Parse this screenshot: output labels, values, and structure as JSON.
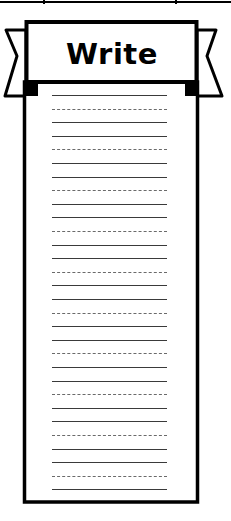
{
  "header": {
    "title": "Write"
  },
  "top_rule": {
    "tick_positions_x": [
      44,
      176
    ]
  },
  "bookmark": {
    "border_color": "#000000",
    "background_color": "#ffffff",
    "line_pattern": [
      "solid",
      "dashed",
      "solid"
    ],
    "line_start_y": 95,
    "line_spacing": 13.6,
    "line_count": 30,
    "lines": [
      "solid",
      "dashed",
      "solid",
      "solid",
      "dashed",
      "solid",
      "solid",
      "dashed",
      "solid",
      "solid",
      "dashed",
      "solid",
      "solid",
      "dashed",
      "solid",
      "solid",
      "dashed",
      "solid",
      "solid",
      "dashed",
      "solid",
      "solid",
      "dashed",
      "solid",
      "solid",
      "dashed",
      "solid",
      "solid",
      "dashed",
      "solid"
    ]
  }
}
